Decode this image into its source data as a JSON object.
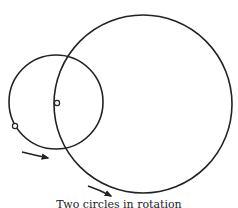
{
  "figure": {
    "stroke_color": "#222222",
    "background": "#ffffff",
    "big_circle": {
      "cx": 143,
      "cy": 104,
      "r": 89
    },
    "small_circle": {
      "cx": 56,
      "cy": 102,
      "r": 47
    },
    "points": [
      {
        "name": "contact-point",
        "cx": 57,
        "cy": 103,
        "r": 2.6
      },
      {
        "name": "tracing-point",
        "cx": 15,
        "cy": 126,
        "r": 2.6
      }
    ],
    "arrows": [
      {
        "name": "small-circle-rotation-arrow",
        "path": "M 22 152 Q 34 155 48 158",
        "head": [
          50,
          158
        ]
      },
      {
        "name": "big-circle-rotation-arrow",
        "path": "M 88 186 Q 100 190 111 196",
        "head": [
          113,
          197
        ]
      }
    ]
  },
  "caption": {
    "text": "Two circles in rotation"
  }
}
